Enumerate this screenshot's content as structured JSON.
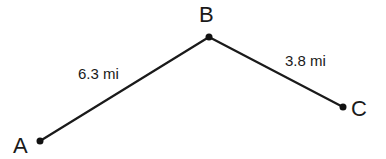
{
  "diagram": {
    "points": [
      {
        "id": "A",
        "label": "A",
        "x": 40,
        "y": 141,
        "label_x": 13,
        "label_y": 153
      },
      {
        "id": "B",
        "label": "B",
        "x": 209,
        "y": 37,
        "label_x": 199,
        "label_y": 22
      },
      {
        "id": "C",
        "label": "C",
        "x": 343,
        "y": 107,
        "label_x": 351,
        "label_y": 116
      }
    ],
    "segments": [
      {
        "from": "A",
        "to": "B",
        "label": "6.3 mi",
        "label_x": 78,
        "label_y": 79
      },
      {
        "from": "B",
        "to": "C",
        "label": "3.8 mi",
        "label_x": 285,
        "label_y": 66
      }
    ],
    "colors": {
      "line": "#1a1a1a",
      "point": "#111111",
      "background": "#ffffff"
    }
  }
}
